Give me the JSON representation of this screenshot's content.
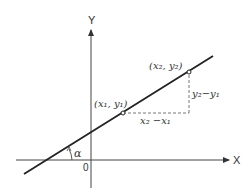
{
  "diagram": {
    "axes": {
      "x_label": "X",
      "y_label": "Y",
      "origin_label": "0"
    },
    "points": [
      {
        "label": "(x₁, y₁)",
        "name": "point-1"
      },
      {
        "label": "(x₂, y₂)",
        "name": "point-2"
      }
    ],
    "annotations": {
      "run": "x₂ −x₁",
      "rise": "y₂−y₁",
      "angle": "α"
    },
    "colors": {
      "line": "#222222",
      "axes": "#333333",
      "dashed": "#555555",
      "background": "#ffffff"
    }
  }
}
